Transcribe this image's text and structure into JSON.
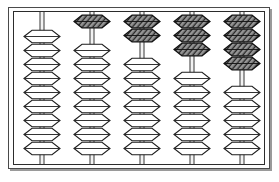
{
  "figure": {
    "frame_color": "#2b2b2b",
    "background_color": "#ffffff",
    "bead_light_fill": "#ffffff",
    "bead_dark_fill": "#3a3a3a",
    "bead_outline_color": "#1d1d1d",
    "rod_color": "#3a3a3a"
  },
  "abacus": {
    "rod_count": 5,
    "beads_per_rod": 9,
    "bead_shape": "lens-hexagon",
    "rods": [
      {
        "name": "rod-1",
        "position_index": 1,
        "raised_dark_beads": 0,
        "lowered_light_beads": 9,
        "value": 0
      },
      {
        "name": "rod-2",
        "position_index": 2,
        "raised_dark_beads": 1,
        "lowered_light_beads": 8,
        "value": 1
      },
      {
        "name": "rod-3",
        "position_index": 3,
        "raised_dark_beads": 2,
        "lowered_light_beads": 7,
        "value": 2
      },
      {
        "name": "rod-4",
        "position_index": 4,
        "raised_dark_beads": 3,
        "lowered_light_beads": 6,
        "value": 3
      },
      {
        "name": "rod-5",
        "position_index": 5,
        "raised_dark_beads": 4,
        "lowered_light_beads": 5,
        "value": 4
      }
    ]
  }
}
